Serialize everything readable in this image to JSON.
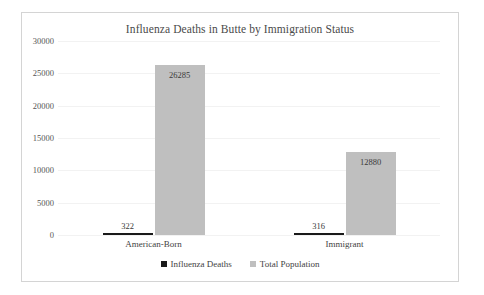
{
  "chart_data": {
    "type": "bar",
    "title": "Influenza Deaths in Butte by Immigration Status",
    "xlabel": "",
    "ylabel": "",
    "categories": [
      "American-Born",
      "Immigrant"
    ],
    "series": [
      {
        "name": "Influenza Deaths",
        "color": "#1a1a1a",
        "values": [
          322,
          316
        ],
        "labels": [
          "322",
          "316"
        ]
      },
      {
        "name": "Total Population",
        "color": "#bfbfbf",
        "values": [
          26285,
          12880
        ],
        "labels": [
          "26285",
          "12880"
        ]
      }
    ],
    "ylim": [
      0,
      30000
    ],
    "yticks": [
      30000,
      25000,
      20000,
      15000,
      10000,
      5000,
      0
    ],
    "ytick_labels": [
      "30000",
      "25000",
      "20000",
      "15000",
      "10000",
      "5000",
      "0"
    ],
    "grid": true,
    "legend_position": "bottom"
  },
  "frame": {
    "border_color": "#d4d4d4",
    "background": "#ffffff"
  }
}
